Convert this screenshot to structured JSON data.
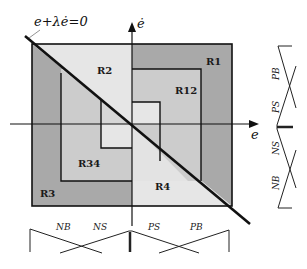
{
  "diagram": {
    "equation_label": "e+λė=0",
    "axes": {
      "x_label": "e",
      "y_label": "ė"
    },
    "regions": [
      {
        "id": "R1",
        "label": "R1"
      },
      {
        "id": "R2",
        "label": "R2"
      },
      {
        "id": "R12",
        "label": "R12"
      },
      {
        "id": "R34",
        "label": "R34"
      },
      {
        "id": "R3",
        "label": "R3"
      },
      {
        "id": "R4",
        "label": "R4"
      }
    ],
    "membership_e": {
      "sets": [
        "NB",
        "NS",
        "PS",
        "PB"
      ]
    },
    "membership_edot": {
      "sets": [
        "PB",
        "PS",
        "NS",
        "NB"
      ]
    },
    "colors": {
      "outer_ring": "#a9a9a9",
      "middle_ring": "#cfcfcf",
      "inner": "#e4e4e4",
      "right_half_light": "#e8e8e8",
      "line": "#111111"
    }
  }
}
